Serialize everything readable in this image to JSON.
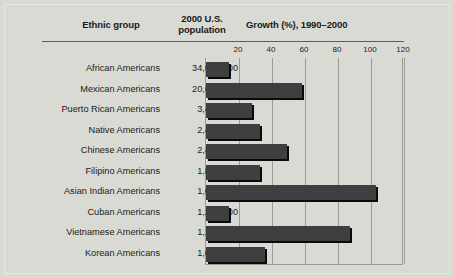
{
  "figure": {
    "background": "#d9dad4",
    "bar_color": "#3f3f3f",
    "shadow_color": "#0a0a0a",
    "rule_color": "#5d5d5d",
    "grid_color": "#9b9c96"
  },
  "headers": {
    "ethnic_group": "Ethnic group",
    "population_line1": "2000 U.S.",
    "population_line2": "population",
    "growth": "Growth (%), 1990–2000"
  },
  "chart_data": {
    "type": "bar",
    "orientation": "horizontal",
    "title": "Growth (%), 1990–2000",
    "xlabel": "Growth (%), 1990–2000",
    "ylabel": "Ethnic group",
    "xlim": [
      0,
      120
    ],
    "xticks": [
      20,
      40,
      60,
      80,
      100,
      120
    ],
    "grid": true,
    "legend": "none",
    "categories": [
      "African Americans",
      "Mexican Americans",
      "Puerto Rican Americans",
      "Native Americans",
      "Chinese Americans",
      "Filipino Americans",
      "Asian Indian Americans",
      "Cuban Americans",
      "Vietnamese Americans",
      "Korean Americans"
    ],
    "values": [
      14,
      58,
      28,
      33,
      49,
      33,
      103,
      14,
      87,
      36
    ],
    "populations": [
      "34,658,000",
      "20,641,000",
      "3,406,000",
      "2,476,000",
      "2,433,000",
      "1,850,000",
      "1,679,000",
      "1,242,000",
      "1,123,000",
      "1,077,000"
    ],
    "population_label": "2000 U.S. population"
  }
}
